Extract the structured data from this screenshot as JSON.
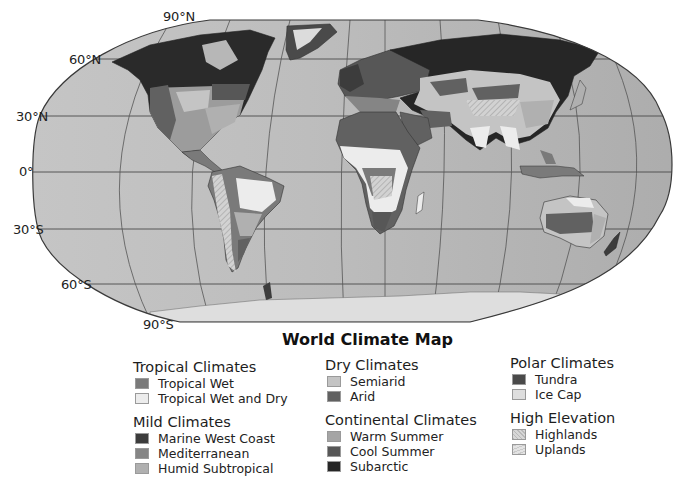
{
  "map": {
    "title": "World Climate Map",
    "projection": "Robinson",
    "ocean_color": "#b4b4b4",
    "latitude_labels": [
      {
        "id": "lat-90n",
        "text": "90°N"
      },
      {
        "id": "lat-60n",
        "text": "60°N"
      },
      {
        "id": "lat-30n",
        "text": "30°N"
      },
      {
        "id": "lat-0",
        "text": "0°"
      },
      {
        "id": "lat-30s",
        "text": "30°S"
      },
      {
        "id": "lat-60s",
        "text": "60°S"
      },
      {
        "id": "lat-90s",
        "text": "90°S"
      }
    ]
  },
  "legend": {
    "groups": [
      {
        "title": "Tropical Climates",
        "items": [
          {
            "label": "Tropical Wet",
            "color": "#7a7a7a"
          },
          {
            "label": "Tropical Wet and Dry",
            "color": "#ececec"
          }
        ]
      },
      {
        "title": "Mild Climates",
        "items": [
          {
            "label": "Marine West Coast",
            "color": "#3c3c3c"
          },
          {
            "label": "Mediterranean",
            "color": "#858585"
          },
          {
            "label": "Humid Subtropical",
            "color": "#b0b0b0"
          }
        ]
      },
      {
        "title": "Dry Climates",
        "items": [
          {
            "label": "Semiarid",
            "color": "#c4c4c4"
          },
          {
            "label": "Arid",
            "color": "#616161"
          }
        ]
      },
      {
        "title": "Continental Climates",
        "items": [
          {
            "label": "Warm Summer",
            "color": "#a5a5a5"
          },
          {
            "label": "Cool Summer",
            "color": "#575757"
          },
          {
            "label": "Subarctic",
            "color": "#262626"
          }
        ]
      },
      {
        "title": "Polar Climates",
        "items": [
          {
            "label": "Tundra",
            "color": "#4a4a4a"
          },
          {
            "label": "Ice Cap",
            "color": "#dedede"
          }
        ]
      },
      {
        "title": "High Elevation",
        "items": [
          {
            "label": "Highlands",
            "color": "#c8c8c8",
            "pattern": "hatch-highlands"
          },
          {
            "label": "Uplands",
            "color": "#dcdcdc",
            "pattern": "hatch-uplands"
          }
        ]
      }
    ]
  }
}
